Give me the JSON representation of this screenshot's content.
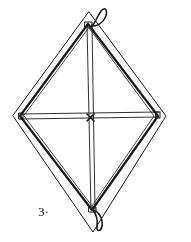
{
  "figure": {
    "step_label": "3·",
    "colors": {
      "stroke": "#1a1a1a",
      "background": "#ffffff"
    }
  }
}
